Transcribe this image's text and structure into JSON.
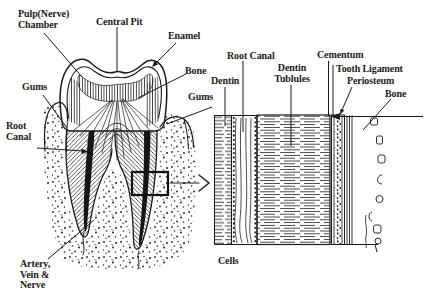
{
  "colors": {
    "ink": "#1a1a1a",
    "background": "#ffffff"
  },
  "tooth_section": {
    "labels": {
      "pulp_chamber": "Pulp(Nerve)\nChamber",
      "central_pit": "Central Pit",
      "enamel": "Enamel",
      "bone": "Bone",
      "gums_left": "Gums",
      "gums_right": "Gums",
      "root_canal": "Root\nCanal",
      "artery_vein_nerve": "Artery,\nVein &\nNerve"
    }
  },
  "magnified_section": {
    "labels": {
      "root_canal": "Root Canal",
      "dentin": "Dentin",
      "dentin_tubules": "Dentin\nTublules",
      "cementum": "Cementum",
      "tooth_ligament": "Tooth Ligament",
      "periosteum": "Periosteum",
      "bone": "Bone",
      "cells": "Cells"
    }
  }
}
